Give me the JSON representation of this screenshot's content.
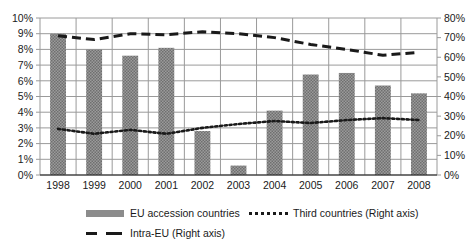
{
  "chart_data": {
    "type": "bar",
    "title": "",
    "subtitle": "",
    "xlabel": "",
    "ylabel": "",
    "categories": [
      "1998",
      "1999",
      "2000",
      "2001",
      "2002",
      "2003",
      "2004",
      "2005",
      "2006",
      "2007",
      "2008"
    ],
    "left_axis": {
      "label": "",
      "ylim": [
        0,
        10
      ],
      "tick_labels": [
        "0%",
        "1%",
        "2%",
        "3%",
        "4%",
        "5%",
        "6%",
        "7%",
        "8%",
        "9%",
        "10%"
      ],
      "tick_values": [
        0,
        1,
        2,
        3,
        4,
        5,
        6,
        7,
        8,
        9,
        10
      ]
    },
    "right_axis": {
      "label": "",
      "ylim": [
        0,
        80
      ],
      "tick_labels": [
        "0%",
        "10%",
        "20%",
        "30%",
        "40%",
        "50%",
        "60%",
        "70%",
        "80%"
      ],
      "tick_values": [
        0,
        10,
        20,
        30,
        40,
        50,
        60,
        70,
        80
      ]
    },
    "grid": true,
    "legend_position": "bottom",
    "series": [
      {
        "name": "EU accession countries",
        "type": "bar",
        "axis": "left",
        "values": [
          9.0,
          8.0,
          7.6,
          8.1,
          2.8,
          0.6,
          4.1,
          6.4,
          6.5,
          5.7,
          5.2
        ]
      },
      {
        "name": "Third countries (Right axis)",
        "type": "line",
        "style": "dotted",
        "axis": "right",
        "values": [
          23.5,
          21.0,
          23.0,
          21.0,
          24.0,
          26.0,
          27.5,
          26.5,
          28.0,
          29.0,
          28.0
        ]
      },
      {
        "name": "Intra-EU (Right axis)",
        "type": "line",
        "style": "dashed",
        "axis": "right",
        "values": [
          71.0,
          69.0,
          72.0,
          71.5,
          73.0,
          72.0,
          70.0,
          66.5,
          64.0,
          61.0,
          62.5
        ]
      }
    ],
    "colors": {
      "bar_fill": "#8c8c8c",
      "line_dark": "#1a1a1a",
      "gridline": "#9a9a9a",
      "text": "#1a1a1a",
      "background": "#ffffff"
    }
  },
  "legend": {
    "items": [
      {
        "label": "EU accession countries",
        "marker": "bar-swatch-icon"
      },
      {
        "label": "Third countries (Right axis)",
        "marker": "dotted-line-swatch-icon"
      },
      {
        "label": "Intra-EU (Right axis)",
        "marker": "dashed-line-swatch-icon"
      }
    ]
  }
}
